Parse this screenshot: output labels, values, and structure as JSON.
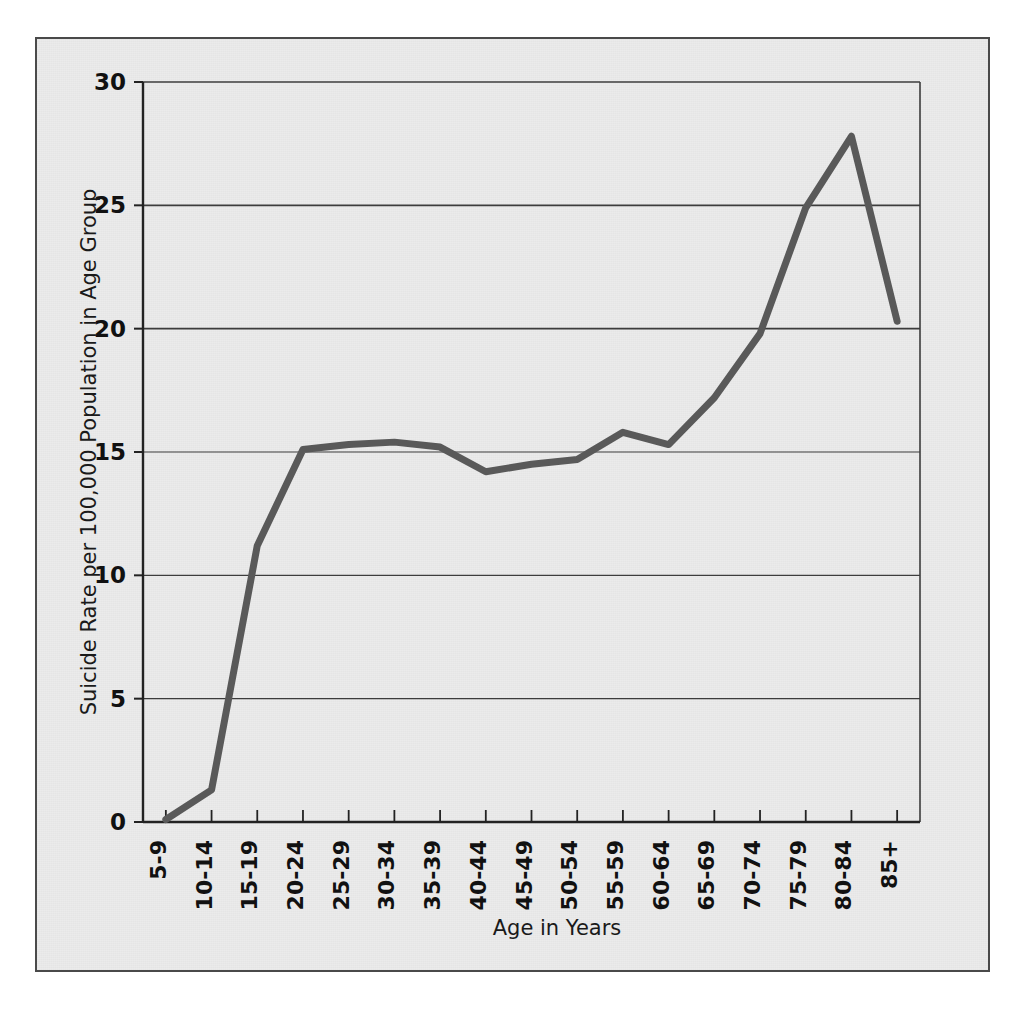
{
  "figure": {
    "background_color": "#ebebeb",
    "frame_color": "#4a4a4a",
    "page_color": "#ffffff"
  },
  "chart_data": {
    "type": "line",
    "title": "",
    "subtitle": "",
    "xlabel": "Age in Years",
    "ylabel": "Suicide Rate per 100,000 Population in Age Group",
    "categories": [
      "5-9",
      "10-14",
      "15-19",
      "20-24",
      "25-29",
      "30-34",
      "35-39",
      "40-44",
      "45-49",
      "50-54",
      "55-59",
      "60-64",
      "65-69",
      "70-74",
      "75-79",
      "80-84",
      "85+"
    ],
    "values": [
      0.1,
      1.3,
      11.2,
      15.1,
      15.3,
      15.4,
      15.2,
      14.2,
      14.5,
      14.7,
      15.8,
      15.3,
      17.2,
      19.8,
      24.9,
      27.8,
      20.3
    ],
    "series": [
      {
        "name": "Suicide Rate",
        "color": "#595959",
        "line_width": 7,
        "values": [
          0.1,
          1.3,
          11.2,
          15.1,
          15.3,
          15.4,
          15.2,
          14.2,
          14.5,
          14.7,
          15.8,
          15.3,
          17.2,
          19.8,
          24.9,
          27.8,
          20.3
        ]
      }
    ],
    "yticks": [
      0,
      5,
      10,
      15,
      20,
      25,
      30
    ],
    "ytick_labels": [
      "0",
      "5",
      "10",
      "15",
      "20",
      "25",
      "30"
    ],
    "ylim": [
      0,
      30
    ],
    "grid": true,
    "grid_color": "#3c3c3c",
    "legend": false,
    "legend_position": "none",
    "annotations": []
  }
}
